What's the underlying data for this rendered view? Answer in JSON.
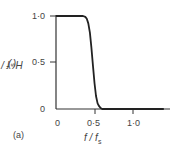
{
  "chart_data": {
    "type": "line",
    "title": "",
    "panel_label": "(a)",
    "xlabel": "f / f_s",
    "ylabel": "H(f / f_s)",
    "xlim": [
      0,
      1.4
    ],
    "ylim": [
      0,
      1.0
    ],
    "grid": false,
    "legend": null,
    "x_ticks": [
      "0",
      "0·5",
      "1·0"
    ],
    "y_ticks": [
      "0",
      "0·5",
      "1·0"
    ],
    "series": [
      {
        "name": "H(f/f_s)",
        "x": [
          0,
          0.1,
          0.2,
          0.3,
          0.35,
          0.38,
          0.4,
          0.42,
          0.44,
          0.46,
          0.48,
          0.5,
          0.52,
          0.54,
          0.56,
          0.58,
          0.6,
          0.65,
          0.8,
          1.0,
          1.2,
          1.4
        ],
        "values": [
          1.0,
          1.0,
          1.0,
          1.0,
          1.0,
          0.99,
          0.97,
          0.92,
          0.82,
          0.66,
          0.46,
          0.28,
          0.14,
          0.06,
          0.03,
          0.01,
          0.0,
          0.0,
          0.0,
          0.0,
          0.0,
          0.0
        ]
      }
    ]
  },
  "labels": {
    "y_tick_1": "1·0",
    "y_tick_05": "0·5",
    "y_tick_0": "0",
    "x_tick_0": "0",
    "x_tick_05": "0·5",
    "x_tick_1": "1·0",
    "ylabel": "H( f / f",
    "ylabel_sub": "s",
    "ylabel_close": ")",
    "xlabel": "f / f",
    "xlabel_sub": "s",
    "panel": "(a)"
  }
}
